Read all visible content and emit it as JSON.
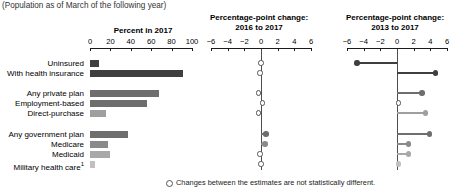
{
  "subtitle": "(Population as of March of the following year)",
  "panels": {
    "p1": {
      "title": "Percent in 2017",
      "ticks": [
        0,
        20,
        40,
        60,
        80,
        100
      ],
      "min": 0,
      "max": 100
    },
    "p2": {
      "title_line1": "Percentage-point change:",
      "title_line2": "2016 to 2017",
      "ticks": [
        -6,
        -4,
        -2,
        0,
        2,
        4,
        6
      ],
      "min": -6,
      "max": 6
    },
    "p3": {
      "title_line1": "Percentage-point change:",
      "title_line2": "2013 to 2017",
      "ticks": [
        -6,
        -4,
        -2,
        0,
        2,
        4,
        6
      ],
      "min": -6,
      "max": 6
    }
  },
  "rows": [
    {
      "label": "Uninsured",
      "footnote": ""
    },
    {
      "label": "With health insurance",
      "footnote": ""
    },
    {
      "label": "Any private plan",
      "footnote": ""
    },
    {
      "label": "Employment-based",
      "footnote": ""
    },
    {
      "label": "Direct-purchase",
      "footnote": ""
    },
    {
      "label": "Any government plan",
      "footnote": ""
    },
    {
      "label": "Medicare",
      "footnote": ""
    },
    {
      "label": "Medicaid",
      "footnote": ""
    },
    {
      "label": "Military health care",
      "footnote": "1"
    }
  ],
  "footnote_text": "Changes between the estimates are not statistically different.",
  "colors": {
    "dark": "#3f3f3f",
    "mid": "#6e6e6e",
    "light": "#9f9f9f",
    "pale": "#c0c0c0",
    "axis": "#1a1a1a",
    "zero": "#4d4d4d"
  },
  "chart_data": {
    "type": "bar",
    "subtitle": "(Population as of March of the following year)",
    "categories": [
      "Uninsured",
      "With health insurance",
      "Any private plan",
      "Employment-based",
      "Direct-purchase",
      "Any government plan",
      "Medicare",
      "Medicaid",
      "Military health care"
    ],
    "group_breaks_after": [
      1,
      4
    ],
    "series": [
      {
        "name": "Percent in 2017",
        "panel": "p1",
        "xlabel": "",
        "ylabel": "",
        "xlim": [
          0,
          100
        ],
        "grid": false,
        "values": [
          8.8,
          91.2,
          67.2,
          56.0,
          16.0,
          37.7,
          17.2,
          19.3,
          4.8
        ],
        "colors": [
          "#3f3f3f",
          "#3f3f3f",
          "#6e6e6e",
          "#6e6e6e",
          "#9f9f9f",
          "#6e6e6e",
          "#8a8a8a",
          "#a8a8a8",
          "#c0c0c0"
        ]
      },
      {
        "name": "Percentage-point change: 2016 to 2017",
        "panel": "p2",
        "type": "dot",
        "xlim": [
          -6,
          6
        ],
        "grid": false,
        "values": [
          0.0,
          -0.1,
          -0.3,
          0.2,
          -0.3,
          0.6,
          0.5,
          -0.1,
          0.0
        ],
        "significant": [
          false,
          false,
          false,
          false,
          false,
          true,
          true,
          false,
          false
        ],
        "colors": [
          "#6e6e6e",
          "#6e6e6e",
          "#6e6e6e",
          "#6e6e6e",
          "#6e6e6e",
          "#6e6e6e",
          "#8a8a8a",
          "#a8a8a8",
          "#c0c0c0"
        ]
      },
      {
        "name": "Percentage-point change: 2013 to 2017",
        "panel": "p3",
        "type": "dot",
        "xlim": [
          -6,
          6
        ],
        "grid": false,
        "values": [
          -4.8,
          4.6,
          3.0,
          0.2,
          3.4,
          3.9,
          1.4,
          1.4,
          0.2
        ],
        "significant": [
          true,
          true,
          true,
          false,
          true,
          true,
          true,
          true,
          true
        ],
        "colors": [
          "#3f3f3f",
          "#3f3f3f",
          "#6e6e6e",
          "#6e6e6e",
          "#9f9f9f",
          "#6e6e6e",
          "#8a8a8a",
          "#a8a8a8",
          "#c0c0c0"
        ]
      }
    ],
    "legend": [
      {
        "marker": "open-circle",
        "label": "Changes between the estimates are not statistically different."
      }
    ],
    "legend_position": "bottom"
  }
}
